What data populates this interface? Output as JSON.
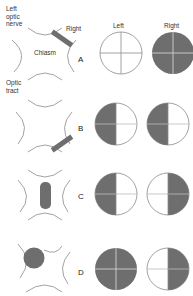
{
  "labels": {
    "left_optic_nerve": [
      "Left",
      "optic",
      "nerve"
    ],
    "optic_tract": [
      "Optic",
      "tract"
    ],
    "chiasm": "Chiasm",
    "right_lesion": "Right",
    "column_left": "Left",
    "column_right": "Right"
  },
  "colors": {
    "stroke": "#8a8a8a",
    "fill_deficit": "#6e6e6e",
    "lesion": "#6e6e6e",
    "background": "#ffffff"
  },
  "rows": [
    {
      "letter": "A",
      "lesion": "right optic nerve (transection)",
      "left_field": "full",
      "right_field": "blind"
    },
    {
      "letter": "B",
      "lesion": "right optic tract near chiasm",
      "left_field": "left half blind",
      "right_field": "left half blind"
    },
    {
      "letter": "C",
      "lesion": "midline chiasm",
      "left_field": "left half blind",
      "right_field": "right half blind"
    },
    {
      "letter": "D",
      "lesion": "left optic nerve at chiasm",
      "left_field": "blind",
      "right_field": "right half blind"
    }
  ]
}
